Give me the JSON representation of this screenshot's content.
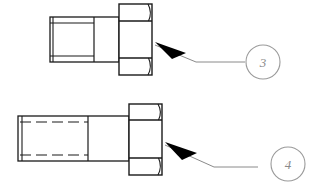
{
  "drawing": {
    "title": "Bolt assembly detail views",
    "background_color": "#ffffff",
    "line_color": "#1a1a1a",
    "leader_color": "#8a8a8a",
    "balloon_stroke_color": "#9a9a9a",
    "balloon_text_color": "#8a8a8a",
    "arrow_fill_color": "#000000",
    "views": [
      {
        "name": "upper-bolt-view",
        "part_label": "3",
        "description": "hex head bolt, externally threaded shank shown with solid thread lines",
        "thread_style": "solid",
        "head_type": "hex-head",
        "body": {
          "shank_x": 50,
          "shank_y": 17,
          "shank_width": 69,
          "shank_height": 45,
          "thread_end_x": 94,
          "chamfer_x": 53
        },
        "head": {
          "x": 119,
          "y": 4,
          "width": 33,
          "height": 71,
          "chamfer_top_y": 21,
          "chamfer_bottom_y": 58
        },
        "leader": {
          "arrow_tip_x": 155,
          "arrow_tip_y": 45,
          "elbow_x": 196,
          "elbow_y": 62,
          "end_x": 245,
          "end_y": 62
        },
        "balloon": {
          "cx": 263,
          "cy": 62,
          "r": 17
        }
      },
      {
        "name": "lower-bolt-view",
        "part_label": "4",
        "description": "hex head bolt, internally threaded shank shown with hidden dashed thread lines",
        "thread_style": "dashed",
        "head_type": "hex-head",
        "body": {
          "shank_x": 18,
          "shank_y": 116,
          "shank_width": 111,
          "shank_height": 45,
          "thread_end_x": 88,
          "chamfer_x": 22
        },
        "head": {
          "x": 129,
          "y": 104,
          "width": 33,
          "height": 71,
          "chamfer_top_y": 120,
          "chamfer_bottom_y": 158
        },
        "leader": {
          "arrow_tip_x": 165,
          "arrow_tip_y": 145,
          "elbow_x": 214,
          "elbow_y": 167,
          "end_x": 258,
          "end_y": 167
        },
        "balloon": {
          "cx": 288,
          "cy": 164,
          "r": 17
        }
      }
    ]
  }
}
